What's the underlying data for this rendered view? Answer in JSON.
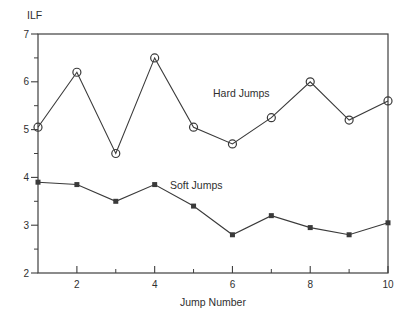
{
  "figure": {
    "ylabel": "ILF",
    "xlabel": "Jump Number",
    "series_labels": {
      "hard": "Hard Jumps",
      "soft": "Soft Jumps"
    }
  },
  "chart_data": {
    "type": "line",
    "title": "",
    "xlabel": "Jump Number",
    "ylabel": "ILF",
    "x": [
      1,
      2,
      3,
      4,
      5,
      6,
      7,
      8,
      9,
      10
    ],
    "series": [
      {
        "name": "Hard Jumps",
        "marker": "open-circle",
        "values": [
          5.05,
          6.2,
          4.5,
          6.5,
          5.05,
          4.7,
          5.25,
          6.0,
          5.2,
          5.6
        ]
      },
      {
        "name": "Soft Jumps",
        "marker": "filled-square",
        "values": [
          3.9,
          3.85,
          3.5,
          3.85,
          3.4,
          2.8,
          3.2,
          2.95,
          2.8,
          3.05
        ]
      }
    ],
    "xlim": [
      1,
      10
    ],
    "ylim": [
      2,
      7
    ],
    "x_major_ticks": [
      2,
      4,
      6,
      8,
      10
    ],
    "x_minor_ticks": [
      3,
      5,
      7,
      9
    ],
    "y_major_ticks": [
      2,
      3,
      4,
      5,
      6,
      7
    ],
    "y_minor_ticks": [
      2.5,
      3.5,
      4.5,
      5.5,
      6.5
    ],
    "grid": false,
    "legend_position": "inline-annotations",
    "colors": {
      "axis": "#3f3f3f",
      "line": "#3a3a3a",
      "text": "#2f2f2f",
      "background": "#ffffff"
    }
  }
}
